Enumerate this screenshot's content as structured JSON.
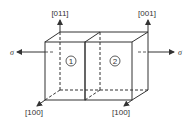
{
  "diagram": {
    "type": "bicrystal-schematic",
    "crystals": [
      {
        "id": "1",
        "label": "1",
        "direction_up": "[011]",
        "direction_front": "[100]"
      },
      {
        "id": "2",
        "label": "2",
        "direction_up": "[001]",
        "direction_front": "[100]"
      }
    ],
    "stress_left": "σ",
    "stress_right": "σ",
    "labels": {
      "top_left": "[011]",
      "top_right": "[001]",
      "bottom_left": "[100]",
      "bottom_right": "[100]"
    },
    "colors": {
      "line": "#333333",
      "background": "#ffffff"
    }
  }
}
